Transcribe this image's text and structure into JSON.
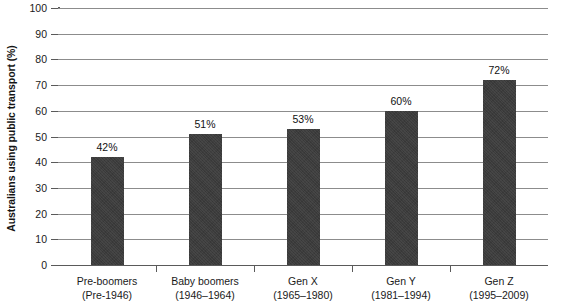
{
  "chart_data": {
    "type": "bar",
    "title": "",
    "xlabel": "",
    "ylabel": "Australians using public transport (%)",
    "ylim": [
      0,
      100
    ],
    "ytick_step": 10,
    "yticks": [
      "0",
      "10",
      "20",
      "30",
      "40",
      "50",
      "60",
      "70",
      "80",
      "90",
      "100"
    ],
    "grid": "horizontal",
    "legend": "none",
    "categories": [
      "Pre-boomers",
      "Baby boomers",
      "Gen X",
      "Gen Y",
      "Gen Z"
    ],
    "category_subtitles": [
      "(Pre-1946)",
      "(1946–1964)",
      "(1965–1980)",
      "(1981–1994)",
      "(1995–2009)"
    ],
    "values": [
      42,
      51,
      53,
      60,
      72
    ],
    "data_labels": [
      "42%",
      "51%",
      "53%",
      "60%",
      "72%"
    ],
    "bar_color": "#3c3c3c",
    "grid_color": "#8c8c8c",
    "axis_color": "#5a5a5a",
    "background_color": "#ffffff"
  }
}
